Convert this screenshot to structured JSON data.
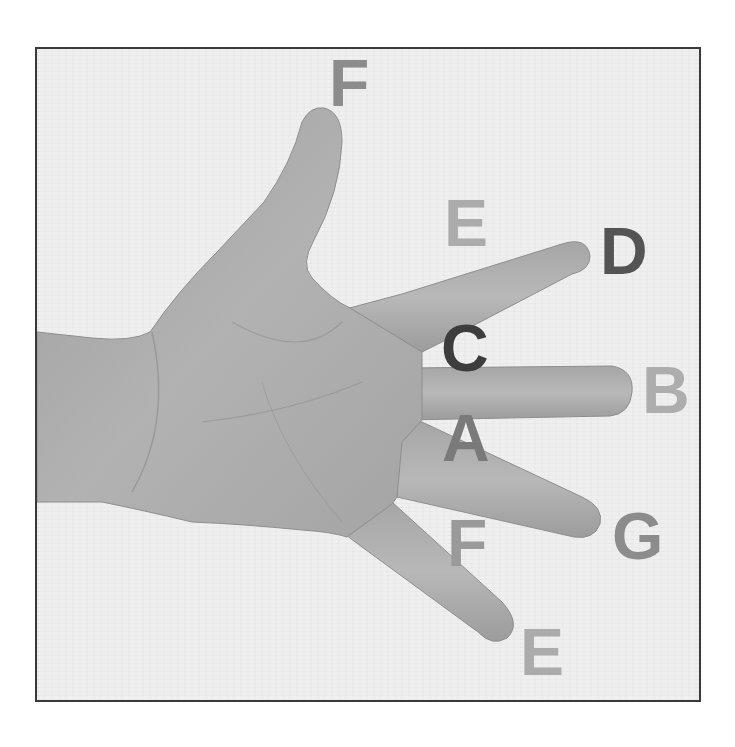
{
  "figure": {
    "frame_border_color": "#3a3a3a",
    "background_color": "#efefef",
    "skin_tone_color": "#a9a9a9"
  },
  "labels": [
    {
      "id": "f-top",
      "text": "F",
      "x": 329,
      "y": 50,
      "color": "#8c8c8c",
      "position": "above thumb tip"
    },
    {
      "id": "e-top",
      "text": "E",
      "x": 444,
      "y": 190,
      "color": "#ababab",
      "position": "gap between thumb and index finger"
    },
    {
      "id": "d",
      "text": "D",
      "x": 600,
      "y": 218,
      "color": "#545454",
      "position": "index finger tip"
    },
    {
      "id": "c",
      "text": "C",
      "x": 441,
      "y": 315,
      "color": "#3d3d3d",
      "position": "gap between index and middle finger"
    },
    {
      "id": "b",
      "text": "B",
      "x": 642,
      "y": 357,
      "color": "#adadad",
      "position": "middle finger tip"
    },
    {
      "id": "a",
      "text": "A",
      "x": 442,
      "y": 405,
      "color": "#7a7a7a",
      "position": "gap between middle and ring finger"
    },
    {
      "id": "g",
      "text": "G",
      "x": 612,
      "y": 503,
      "color": "#8c8c8c",
      "position": "ring finger tip"
    },
    {
      "id": "f-bottom",
      "text": "F",
      "x": 447,
      "y": 510,
      "color": "#9a9a9a",
      "position": "gap between ring and little finger"
    },
    {
      "id": "e-bottom",
      "text": "E",
      "x": 520,
      "y": 619,
      "color": "#ababab",
      "position": "little finger tip"
    }
  ]
}
